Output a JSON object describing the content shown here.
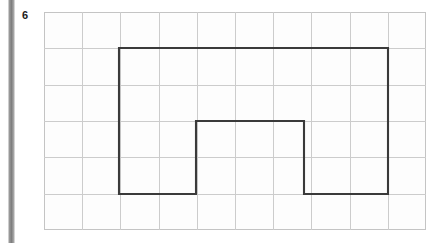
{
  "page": {
    "width": 444,
    "height": 243,
    "background_color": "#ffffff",
    "edge_bar_color": "#7e7e7e"
  },
  "question": {
    "number": "6"
  },
  "grid": {
    "columns": 10,
    "rows": 6,
    "origin_x": 44,
    "origin_y": 12,
    "cell_width": 38.2,
    "cell_height": 36.33,
    "line_color": "#cccccc",
    "border_color": "#c4c4c4"
  },
  "figure": {
    "name": "notched-rectangle",
    "stroke_color": "#3a3a3a",
    "stroke_width": 2.1,
    "fill": "none",
    "vertices_px": [
      [
        75,
        36
      ],
      [
        344,
        36
      ],
      [
        344,
        182
      ],
      [
        260,
        182
      ],
      [
        260,
        109
      ],
      [
        152,
        109
      ],
      [
        152,
        182
      ],
      [
        75,
        182
      ]
    ],
    "vertices_grid": [
      [
        2,
        1
      ],
      [
        9,
        1
      ],
      [
        9,
        5
      ],
      [
        6.8,
        5
      ],
      [
        6.8,
        3
      ],
      [
        4,
        3
      ],
      [
        4,
        5
      ],
      [
        2,
        5
      ]
    ],
    "path_d": "M 75 36 L 344 36 L 344 182 L 260 182 L 260 109 L 152 109 L 152 182 L 75 182 Z"
  }
}
